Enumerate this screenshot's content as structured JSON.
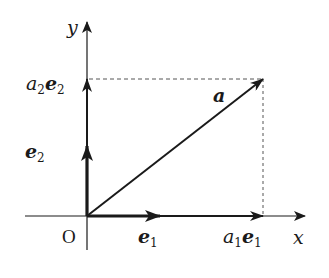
{
  "diagram": {
    "type": "vector-decomposition",
    "colors": {
      "stroke": "#1a1a1a",
      "dashed": "#555555",
      "background": "#ffffff"
    },
    "axes": {
      "x_label": "x",
      "y_label": "y",
      "origin_label": "O"
    },
    "vectors": {
      "a": {
        "label": "a"
      },
      "e1": {
        "label_base": "e",
        "label_sub": "1"
      },
      "e2": {
        "label_base": "e",
        "label_sub": "2"
      }
    },
    "components": {
      "a1e1": {
        "coef_base": "a",
        "coef_sub": "1",
        "vec_base": "e",
        "vec_sub": "1"
      },
      "a2e2": {
        "coef_base": "a",
        "coef_sub": "2",
        "vec_base": "e",
        "vec_sub": "2"
      }
    }
  }
}
